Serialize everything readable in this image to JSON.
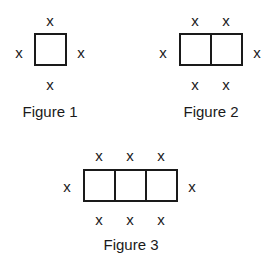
{
  "figures": [
    {
      "caption": "Figure 1",
      "units": 1,
      "box": {
        "x": 34,
        "y": 33,
        "w": 33,
        "h": 33
      },
      "top_marks": [
        "x"
      ],
      "bottom_marks": [
        "x"
      ],
      "left_mark": "x",
      "right_mark": "x"
    },
    {
      "caption": "Figure 2",
      "units": 2,
      "box": {
        "x": 179,
        "y": 33,
        "w": 64,
        "h": 33
      },
      "top_marks": [
        "x",
        "x"
      ],
      "bottom_marks": [
        "x",
        "x"
      ],
      "left_mark": "x",
      "right_mark": "x"
    },
    {
      "caption": "Figure 3",
      "units": 3,
      "box": {
        "x": 83,
        "y": 169,
        "w": 95,
        "h": 33
      },
      "top_marks": [
        "x",
        "x",
        "x"
      ],
      "bottom_marks": [
        "x",
        "x",
        "x"
      ],
      "left_mark": "x",
      "right_mark": "x"
    }
  ]
}
